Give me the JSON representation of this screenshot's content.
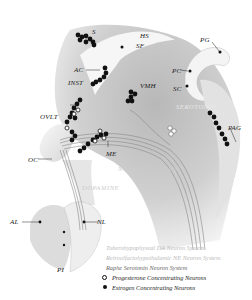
{
  "figure": {
    "type": "neuroanatomy sagittal diagram",
    "colors": {
      "background": "#ffffff",
      "tissue_gray": "#c8c8c8",
      "tissue_light": "#e6e6e6",
      "estrogen_neuron": "#111111",
      "progesterone_neuron": "#ffffff"
    }
  },
  "labels": {
    "s": "S",
    "hs": "HS",
    "sf": "SF",
    "pg": "PG",
    "ac": "AC",
    "inst": "INST",
    "vmh": "VMH",
    "pc": "PC",
    "sc": "SC",
    "serotonin": "SEROTONIN",
    "pag": "PAG",
    "ovlt": "OVLT",
    "oc": "OC",
    "me": "ME",
    "norepinephrine": "NOREPINEPHRINE",
    "dopamine": "DOPAMINE",
    "al": "AL",
    "nl": "NL",
    "pi": "PI"
  },
  "legend": {
    "items": [
      {
        "label": "Tuberohypophyseal DA Neuron System",
        "symbol": "none",
        "tone": "faint"
      },
      {
        "label": "Retroolfactohypothalamic NE Neuron System",
        "symbol": "none",
        "tone": "faint"
      },
      {
        "label": "Raphe Serotonin Neuron System",
        "symbol": "none",
        "tone": "mid"
      },
      {
        "label": "Progesterone Concentrating Neurons",
        "symbol": "open-circle",
        "tone": "dark"
      },
      {
        "label": "Estrogen Concentrating Neurons",
        "symbol": "filled-circle",
        "tone": "dark"
      }
    ]
  }
}
